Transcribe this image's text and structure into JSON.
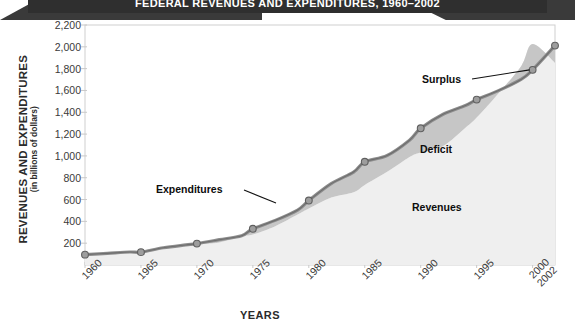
{
  "banner": {
    "title": "FEDERAL REVENUES AND EXPENDITURES, 1960–2002"
  },
  "axes": {
    "y_title_main": "REVENUES AND EXPENDITURES",
    "y_title_sub": "(in billions of dollars)",
    "x_title": "YEARS"
  },
  "annotations": {
    "expenditures": "Expenditures",
    "revenues": "Revenues",
    "deficit": "Deficit",
    "surplus": "Surplus"
  },
  "chart_data": {
    "type": "area",
    "title": "Federal Revenues and Expenditures, 1960–2002",
    "xlabel": "YEARS",
    "ylabel": "REVENUES AND EXPENDITURES (in billions of dollars)",
    "ylim": [
      0,
      2200
    ],
    "xlim": [
      1960,
      2002
    ],
    "grid": false,
    "legend": "inline-annotations",
    "ytick_labels": [
      "200",
      "400",
      "600",
      "800",
      "1,000",
      "1,200",
      "1,400",
      "1,600",
      "1,800",
      "2,000",
      "2,200"
    ],
    "ytick_values": [
      200,
      400,
      600,
      800,
      1000,
      1200,
      1400,
      1600,
      1800,
      2000,
      2200
    ],
    "xtick_labels": [
      "1960",
      "1965",
      "1970",
      "1975",
      "1980",
      "1985",
      "1990",
      "1995",
      "2000",
      "2002"
    ],
    "xtick_values": [
      1960,
      1965,
      1970,
      1975,
      1980,
      1985,
      1990,
      1995,
      2000,
      2002
    ],
    "marker_years": [
      1960,
      1965,
      1970,
      1975,
      1980,
      1985,
      1990,
      1995,
      2000,
      2002
    ],
    "series": [
      {
        "name": "Expenditures",
        "x": [
          1960,
          1962,
          1964,
          1965,
          1967,
          1969,
          1970,
          1972,
          1974,
          1975,
          1977,
          1979,
          1980,
          1982,
          1984,
          1985,
          1987,
          1989,
          1990,
          1992,
          1994,
          1995,
          1997,
          1999,
          2000,
          2002
        ],
        "values": [
          95,
          107,
          119,
          118,
          158,
          184,
          196,
          232,
          269,
          332,
          409,
          504,
          591,
          746,
          852,
          946,
          1004,
          1144,
          1253,
          1382,
          1462,
          1516,
          1601,
          1703,
          1789,
          2011
        ]
      },
      {
        "name": "Revenues",
        "x": [
          1960,
          1962,
          1964,
          1965,
          1967,
          1969,
          1970,
          1972,
          1974,
          1975,
          1977,
          1979,
          1980,
          1982,
          1984,
          1985,
          1987,
          1989,
          1990,
          1992,
          1994,
          1995,
          1997,
          1999,
          2000,
          2002
        ],
        "values": [
          92,
          100,
          113,
          117,
          149,
          187,
          193,
          207,
          263,
          279,
          356,
          463,
          517,
          618,
          667,
          734,
          854,
          991,
          1032,
          1091,
          1258,
          1351,
          1579,
          1827,
          2025,
          1853
        ]
      }
    ],
    "bands": [
      {
        "name": "Deficit",
        "fill": "#c4c4c4",
        "meaning": "Expenditures above Revenues"
      },
      {
        "name": "Surplus",
        "fill": "#c4c4c4",
        "meaning": "Revenues above Expenditures, late 1990s–2000"
      }
    ],
    "colors": {
      "line": "#8a8a8a",
      "line_dark": "#6f6f6f",
      "revenues_fill": "#efefef",
      "deficit_fill": "#c6c6c6",
      "marker": "#9a9a9a",
      "text": "#2b2b2b"
    }
  }
}
